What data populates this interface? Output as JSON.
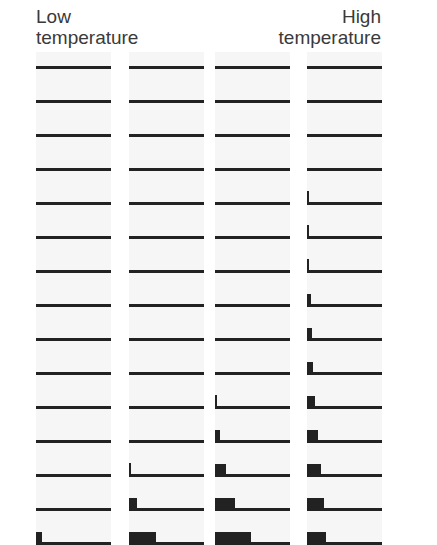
{
  "labels": {
    "low_line1": "Low",
    "low_line2": "temperature",
    "high_line1": "High",
    "high_line2": "temperature"
  },
  "colors": {
    "ink": "#222222",
    "panel": "#f6f6f6"
  },
  "chart_data": {
    "type": "bar",
    "title": "",
    "xlabel_left": "Low temperature",
    "xlabel_right": "High temperature",
    "rows": 15,
    "columns": [
      {
        "name": "col1",
        "bar_widths_px": [
          0,
          0,
          0,
          0,
          0,
          0,
          0,
          0,
          0,
          0,
          0,
          0,
          0,
          0,
          6
        ]
      },
      {
        "name": "col2",
        "bar_widths_px": [
          0,
          0,
          0,
          0,
          0,
          0,
          0,
          0,
          0,
          0,
          0,
          0,
          2,
          8,
          27
        ]
      },
      {
        "name": "col3",
        "bar_widths_px": [
          0,
          0,
          0,
          0,
          0,
          0,
          0,
          0,
          0,
          0,
          2,
          5,
          11,
          20,
          36
        ]
      },
      {
        "name": "col4",
        "bar_widths_px": [
          0,
          0,
          0,
          0,
          2,
          2,
          2,
          4,
          5,
          6,
          8,
          11,
          14,
          17,
          19
        ]
      }
    ]
  }
}
